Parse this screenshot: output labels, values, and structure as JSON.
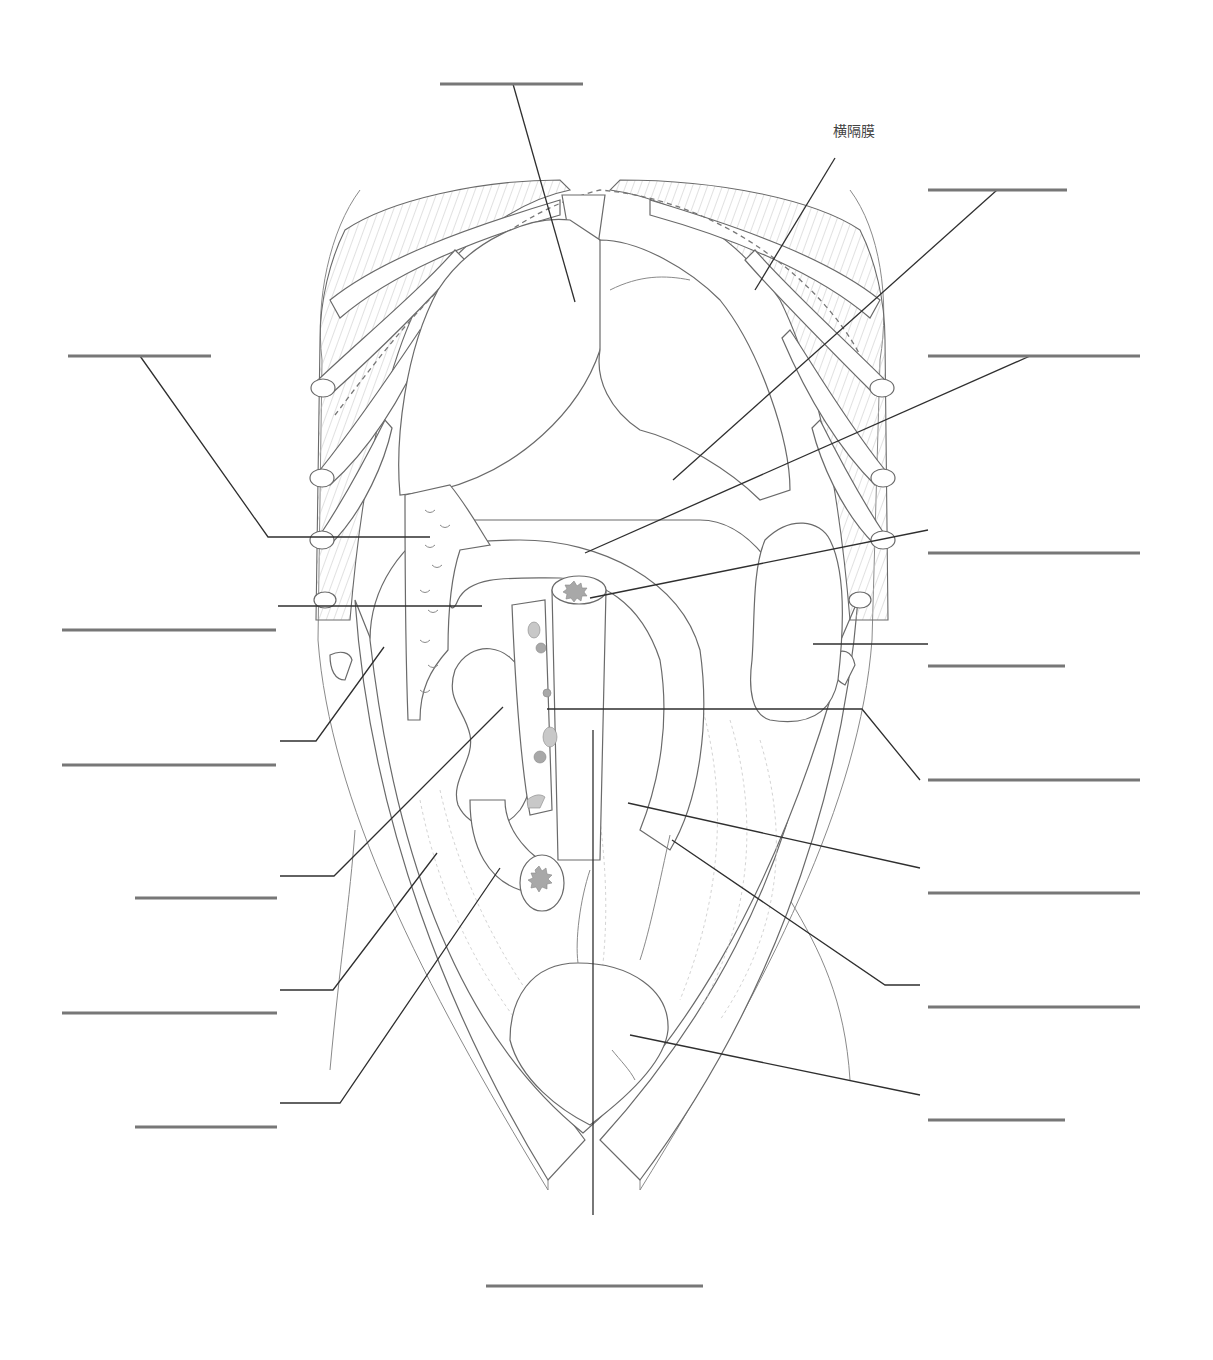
{
  "diagram": {
    "type": "anatomical-labeling-worksheet",
    "visible_labels": [
      {
        "id": "diaphragm",
        "text": "横隔膜",
        "x": 833,
        "y": 118
      }
    ],
    "blank_label_lines": [
      {
        "id": "blank-top-center",
        "x1": 440,
        "x2": 583,
        "y": 84,
        "points_to": [
          575,
          300
        ]
      },
      {
        "id": "blank-right-1",
        "x1": 928,
        "x2": 1067,
        "y": 190,
        "points_to": [
          673,
          480
        ]
      },
      {
        "id": "blank-right-2",
        "x1": 928,
        "x2": 1140,
        "y": 356,
        "points_to": [
          585,
          553
        ]
      },
      {
        "id": "blank-left-1",
        "x1": 68,
        "x2": 211,
        "y": 356,
        "points_to": [
          430,
          537
        ]
      },
      {
        "id": "blank-right-3",
        "x1": 928,
        "x2": 1140,
        "y": 553,
        "points_to": [
          590,
          598
        ]
      },
      {
        "id": "blank-left-2",
        "x1": 62,
        "x2": 276,
        "y": 630,
        "points_to": [
          482,
          606
        ]
      },
      {
        "id": "blank-right-4",
        "x1": 928,
        "x2": 1065,
        "y": 666,
        "points_to": [
          813,
          644
        ]
      },
      {
        "id": "blank-left-3",
        "x1": 62,
        "x2": 276,
        "y": 765,
        "points_to": [
          384,
          647
        ]
      },
      {
        "id": "blank-right-5",
        "x1": 928,
        "x2": 1140,
        "y": 780,
        "points_to": [
          547,
          709
        ]
      },
      {
        "id": "blank-left-4",
        "x1": 135,
        "x2": 277,
        "y": 898,
        "points_to": [
          503,
          707
        ]
      },
      {
        "id": "blank-right-6",
        "x1": 928,
        "x2": 1140,
        "y": 893,
        "points_to": [
          628,
          803
        ]
      },
      {
        "id": "blank-left-5",
        "x1": 62,
        "x2": 277,
        "y": 1013,
        "points_to": [
          437,
          853
        ]
      },
      {
        "id": "blank-right-7",
        "x1": 928,
        "x2": 1140,
        "y": 1007,
        "points_to": [
          672,
          840
        ]
      },
      {
        "id": "blank-left-6",
        "x1": 135,
        "x2": 277,
        "y": 1127,
        "points_to": [
          500,
          868
        ]
      },
      {
        "id": "blank-right-8",
        "x1": 928,
        "x2": 1065,
        "y": 1120,
        "points_to": [
          630,
          1035
        ]
      },
      {
        "id": "blank-bottom-center",
        "x1": 486,
        "x2": 703,
        "y": 1286,
        "points_to": [
          593,
          730
        ]
      }
    ],
    "colors": {
      "outline": "#6a6a6a",
      "leader": "#2f2f2f",
      "blank_line": "#777777",
      "hatch": "#c4c4c4",
      "lumen": "#a8a8a8"
    }
  }
}
